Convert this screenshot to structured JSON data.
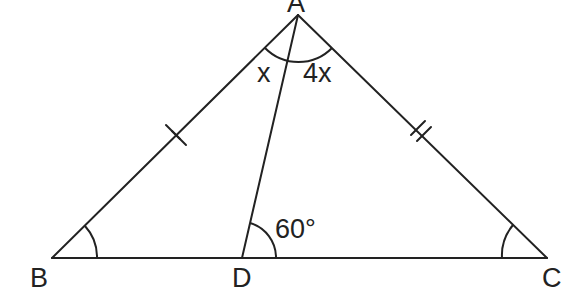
{
  "diagram": {
    "type": "geometry-triangle",
    "points": {
      "A": {
        "label": "A",
        "x": 298,
        "y": 15
      },
      "B": {
        "label": "B",
        "x": 52,
        "y": 258
      },
      "C": {
        "label": "C",
        "x": 547,
        "y": 258
      },
      "D": {
        "label": "D",
        "x": 242,
        "y": 258
      }
    },
    "segments": [
      "AB",
      "AC",
      "BC",
      "AD"
    ],
    "equal_marks": {
      "AB": "double-tick",
      "AC": "double-tick"
    },
    "angles": {
      "BAD": "x",
      "DAC": "4x",
      "ADC": "60°",
      "ABC": "",
      "ACB": ""
    },
    "colors": {
      "stroke": "#222222",
      "background": "#ffffff"
    }
  }
}
